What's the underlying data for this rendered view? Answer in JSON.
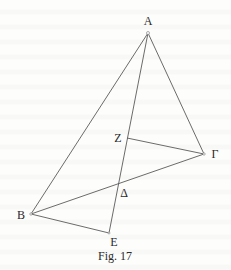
{
  "figure": {
    "caption": "Fig. 17",
    "colors": {
      "line": "#5a5a5a",
      "text": "#2a2a2a",
      "background": "#fdfdfc"
    }
  },
  "points": {
    "A": {
      "label": "A",
      "x": 148,
      "y": 33,
      "lx": 148,
      "ly": 25
    },
    "Z": {
      "label": "Z",
      "x": 127,
      "y": 138,
      "lx": 118,
      "ly": 142
    },
    "G": {
      "label": "Γ",
      "x": 204,
      "y": 154,
      "lx": 215,
      "ly": 158
    },
    "D": {
      "label": "Δ",
      "x": 118,
      "y": 185,
      "lx": 124,
      "ly": 197
    },
    "B": {
      "label": "B",
      "x": 31,
      "y": 214,
      "lx": 21,
      "ly": 219
    },
    "E": {
      "label": "E",
      "x": 109,
      "y": 233,
      "lx": 114,
      "ly": 246
    }
  },
  "segments": [
    {
      "name": "AB",
      "from": "A",
      "to": "B"
    },
    {
      "name": "AG",
      "from": "A",
      "to": "G"
    },
    {
      "name": "AE",
      "from": "A",
      "to": "E"
    },
    {
      "name": "ZG",
      "from": "Z",
      "to": "G"
    },
    {
      "name": "BG",
      "from": "B",
      "to": "G"
    },
    {
      "name": "BE",
      "from": "B",
      "to": "E"
    }
  ]
}
